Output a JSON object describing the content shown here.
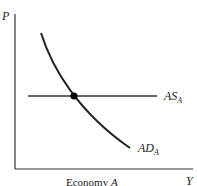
{
  "diagram": {
    "y_axis_label": "P",
    "x_axis_label": "Y",
    "caption": "Economy",
    "caption_var": "A",
    "curves": [
      {
        "name": "AS",
        "subscript": "A",
        "kind": "horizontal aggregate supply",
        "color": "#666666"
      },
      {
        "name": "AD",
        "subscript": "A",
        "kind": "downward sloping aggregate demand",
        "color": "#222222"
      }
    ],
    "equilibrium_point": {
      "label": "",
      "color": "#000000"
    }
  }
}
